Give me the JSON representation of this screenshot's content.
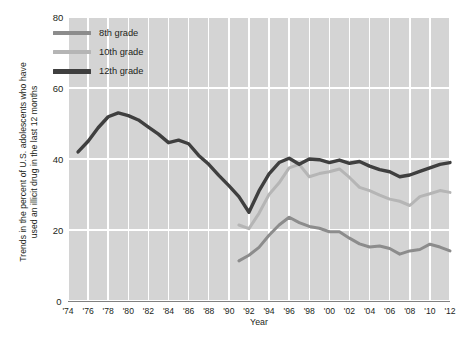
{
  "chart_data": {
    "type": "line",
    "title": "",
    "xlabel": "Year",
    "ylabel": "Trends in the percent of U.S. adolescents  who have used an illicit drug in the last 12 months",
    "xlim": [
      1974,
      2012
    ],
    "ylim": [
      0,
      80
    ],
    "ytick_values": [
      0,
      20,
      40,
      60,
      80
    ],
    "xtick_labels": [
      "'74",
      "'76",
      "'78",
      "'80",
      "'82",
      "'84",
      "'86",
      "'88",
      "'90",
      "'92",
      "'94",
      "'96",
      "'98",
      "'00",
      "'02",
      "'04",
      "'06",
      "'08",
      "'10",
      "'12"
    ],
    "xtick_values": [
      1974,
      1976,
      1978,
      1980,
      1982,
      1984,
      1986,
      1988,
      1990,
      1992,
      1994,
      1996,
      1998,
      2000,
      2002,
      2004,
      2006,
      2008,
      2010,
      2012
    ],
    "grid": true,
    "legend_position": "upper-left-inside",
    "plot_background": "#d4d4d4",
    "series": [
      {
        "name": "8th grade",
        "color": "#8c8c8c",
        "x": [
          1991,
          1992,
          1993,
          1994,
          1995,
          1996,
          1997,
          1998,
          1999,
          2000,
          2001,
          2002,
          2003,
          2004,
          2005,
          2006,
          2007,
          2008,
          2009,
          2010,
          2011,
          2012
        ],
        "values": [
          11.3,
          12.9,
          15.1,
          18.5,
          21.4,
          23.6,
          22.1,
          21.0,
          20.5,
          19.5,
          19.5,
          17.7,
          16.1,
          15.2,
          15.5,
          14.8,
          13.2,
          14.1,
          14.5,
          16.0,
          15.2,
          14.1
        ]
      },
      {
        "name": "10th grade",
        "color": "#b5b5b5",
        "x": [
          1991,
          1992,
          1993,
          1994,
          1995,
          1996,
          1997,
          1998,
          1999,
          2000,
          2001,
          2002,
          2003,
          2004,
          2005,
          2006,
          2007,
          2008,
          2009,
          2010,
          2011,
          2012
        ],
        "values": [
          21.4,
          20.4,
          24.7,
          30.0,
          33.3,
          37.5,
          38.5,
          35.0,
          35.9,
          36.4,
          37.2,
          34.8,
          32.0,
          31.1,
          29.8,
          28.7,
          28.1,
          26.9,
          29.4,
          30.2,
          31.1,
          30.6
        ]
      },
      {
        "name": "12th grade",
        "color": "#3f3f3f",
        "x": [
          1975,
          1976,
          1977,
          1978,
          1979,
          1980,
          1981,
          1982,
          1983,
          1984,
          1985,
          1986,
          1987,
          1988,
          1989,
          1990,
          1991,
          1992,
          1993,
          1994,
          1995,
          1996,
          1997,
          1998,
          1999,
          2000,
          2001,
          2002,
          2003,
          2004,
          2005,
          2006,
          2007,
          2008,
          2009,
          2010,
          2011,
          2012
        ],
        "values": [
          42.0,
          45.0,
          48.8,
          51.9,
          53.0,
          52.2,
          51.0,
          49.0,
          47.0,
          44.6,
          45.3,
          44.3,
          41.0,
          38.5,
          35.4,
          32.5,
          29.4,
          25.0,
          31.0,
          35.8,
          39.0,
          40.2,
          38.5,
          40.0,
          39.8,
          39.0,
          39.7,
          38.8,
          39.3,
          38.0,
          37.0,
          36.4,
          35.0,
          35.5,
          36.5,
          37.5,
          38.5,
          39.0
        ]
      }
    ]
  },
  "legend": {
    "items": [
      {
        "label": "8th grade"
      },
      {
        "label": "10th grade"
      },
      {
        "label": "12th grade"
      }
    ]
  },
  "axis": {
    "y_title_line1": "Trends in the percent of U.S. adolescents  who have",
    "y_title_line2": "used an illicit drug in the last 12 months",
    "x_title": "Year"
  }
}
